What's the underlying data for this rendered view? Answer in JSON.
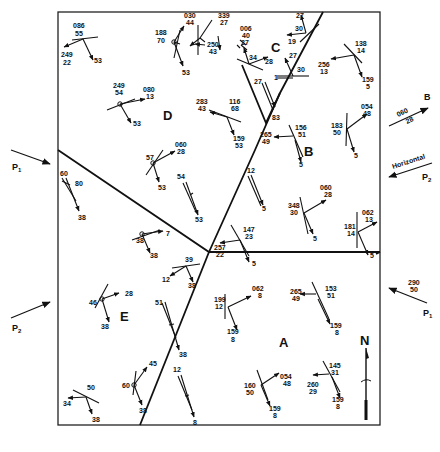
{
  "diagram": {
    "type": "structural-geology-map",
    "zones": [
      {
        "id": "A",
        "label": "A",
        "x": 284,
        "y": 342
      },
      {
        "id": "B",
        "label": "B",
        "x": 308,
        "y": 151
      },
      {
        "id": "C",
        "label": "C",
        "x": 276,
        "y": 48
      },
      {
        "id": "D",
        "label": "D",
        "x": 168,
        "y": 115
      },
      {
        "id": "E",
        "label": "E",
        "x": 125,
        "y": 316
      }
    ],
    "north_arrow": {
      "label": "N"
    },
    "external_stresses": [
      {
        "id": "P1-west",
        "label": "P",
        "sub": "1"
      },
      {
        "id": "P2-west",
        "label": "P",
        "sub": "2"
      },
      {
        "id": "B-east",
        "label": "B",
        "value_top": "060",
        "value_bottom": "28"
      },
      {
        "id": "P2-east",
        "label": "P",
        "sub": "2",
        "note": "Horizontal"
      },
      {
        "id": "P1-east",
        "label": "P",
        "sub": "1",
        "value_top": "290",
        "value_bottom": "50"
      }
    ],
    "labels": [
      {
        "t": "086",
        "x": 73,
        "y": 28
      },
      {
        "t": "55",
        "x": 75,
        "y": 36
      },
      {
        "t": "249",
        "x": 61,
        "y": 57
      },
      {
        "t": "22",
        "x": 63,
        "y": 65
      },
      {
        "t": "53",
        "x": 94,
        "y": 63
      },
      {
        "t": "030",
        "x": 184,
        "y": 18
      },
      {
        "t": "44",
        "x": 186,
        "y": 25
      },
      {
        "t": "188",
        "x": 155,
        "y": 35
      },
      {
        "t": "70",
        "x": 157,
        "y": 43
      },
      {
        "t": "53",
        "x": 182,
        "y": 75
      },
      {
        "t": "339",
        "x": 218,
        "y": 18
      },
      {
        "t": "27",
        "x": 220,
        "y": 25
      },
      {
        "t": "006",
        "x": 240,
        "y": 31
      },
      {
        "t": "40",
        "x": 242,
        "y": 38
      },
      {
        "t": "250",
        "x": 207,
        "y": 47
      },
      {
        "t": "43",
        "x": 209,
        "y": 54
      },
      {
        "t": "27",
        "x": 241,
        "y": 45
      },
      {
        "t": "34",
        "x": 249,
        "y": 60
      },
      {
        "t": "28",
        "x": 265,
        "y": 64
      },
      {
        "t": "27",
        "x": 296,
        "y": 18
      },
      {
        "t": "30",
        "x": 295,
        "y": 31
      },
      {
        "t": "19",
        "x": 288,
        "y": 44
      },
      {
        "t": "27",
        "x": 289,
        "y": 58
      },
      {
        "t": "30",
        "x": 297,
        "y": 72
      },
      {
        "t": "1",
        "x": 274,
        "y": 80
      },
      {
        "t": "27",
        "x": 254,
        "y": 84
      },
      {
        "t": "83",
        "x": 272,
        "y": 120
      },
      {
        "t": "138",
        "x": 355,
        "y": 46
      },
      {
        "t": "14",
        "x": 357,
        "y": 53
      },
      {
        "t": "256",
        "x": 318,
        "y": 67
      },
      {
        "t": "13",
        "x": 320,
        "y": 74
      },
      {
        "t": "159",
        "x": 362,
        "y": 82
      },
      {
        "t": "5",
        "x": 366,
        "y": 89
      },
      {
        "t": "249",
        "x": 113,
        "y": 88
      },
      {
        "t": "54",
        "x": 115,
        "y": 95
      },
      {
        "t": "080",
        "x": 143,
        "y": 92
      },
      {
        "t": "13",
        "x": 146,
        "y": 99
      },
      {
        "t": "53",
        "x": 133,
        "y": 126
      },
      {
        "t": "283",
        "x": 196,
        "y": 104
      },
      {
        "t": "43",
        "x": 198,
        "y": 111
      },
      {
        "t": "116",
        "x": 229,
        "y": 104
      },
      {
        "t": "68",
        "x": 231,
        "y": 111
      },
      {
        "t": "159",
        "x": 233,
        "y": 141
      },
      {
        "t": "53",
        "x": 235,
        "y": 148
      },
      {
        "t": "265",
        "x": 260,
        "y": 137
      },
      {
        "t": "49",
        "x": 262,
        "y": 144
      },
      {
        "t": "156",
        "x": 295,
        "y": 130
      },
      {
        "t": "51",
        "x": 298,
        "y": 137
      },
      {
        "t": "5",
        "x": 299,
        "y": 167
      },
      {
        "t": "183",
        "x": 331,
        "y": 128
      },
      {
        "t": "50",
        "x": 333,
        "y": 135
      },
      {
        "t": "054",
        "x": 361,
        "y": 109
      },
      {
        "t": "48",
        "x": 363,
        "y": 116
      },
      {
        "t": "5",
        "x": 354,
        "y": 158
      },
      {
        "t": "057",
        "x": 0,
        "y": 0
      },
      {
        "t": "060",
        "x": 175,
        "y": 147
      },
      {
        "t": "28",
        "x": 177,
        "y": 154
      },
      {
        "t": "57",
        "x": 146,
        "y": 160
      },
      {
        "t": "53",
        "x": 158,
        "y": 190
      },
      {
        "t": "54",
        "x": 177,
        "y": 179
      },
      {
        "t": "53",
        "x": 195,
        "y": 222
      },
      {
        "t": "60",
        "x": 60,
        "y": 176
      },
      {
        "t": "80",
        "x": 75,
        "y": 186
      },
      {
        "t": "38",
        "x": 78,
        "y": 220
      },
      {
        "t": "12",
        "x": 247,
        "y": 173
      },
      {
        "t": "5",
        "x": 262,
        "y": 211
      },
      {
        "t": "060",
        "x": 320,
        "y": 190
      },
      {
        "t": "28",
        "x": 324,
        "y": 197
      },
      {
        "t": "348",
        "x": 288,
        "y": 208
      },
      {
        "t": "30",
        "x": 290,
        "y": 215
      },
      {
        "t": "5",
        "x": 313,
        "y": 241
      },
      {
        "t": "062",
        "x": 362,
        "y": 215
      },
      {
        "t": "13",
        "x": 365,
        "y": 222
      },
      {
        "t": "181",
        "x": 344,
        "y": 229
      },
      {
        "t": "14",
        "x": 347,
        "y": 236
      },
      {
        "t": "5",
        "x": 370,
        "y": 258
      },
      {
        "t": "147",
        "x": 243,
        "y": 232
      },
      {
        "t": "23",
        "x": 245,
        "y": 239
      },
      {
        "t": "257",
        "x": 214,
        "y": 250
      },
      {
        "t": "22",
        "x": 216,
        "y": 257
      },
      {
        "t": "5",
        "x": 252,
        "y": 266
      },
      {
        "t": "7",
        "x": 166,
        "y": 236
      },
      {
        "t": "38",
        "x": 136,
        "y": 243
      },
      {
        "t": "38",
        "x": 150,
        "y": 258
      },
      {
        "t": "39",
        "x": 185,
        "y": 262
      },
      {
        "t": "12",
        "x": 162,
        "y": 282
      },
      {
        "t": "38",
        "x": 188,
        "y": 288
      },
      {
        "t": "28",
        "x": 125,
        "y": 296
      },
      {
        "t": "46",
        "x": 89,
        "y": 305
      },
      {
        "t": "38",
        "x": 101,
        "y": 329
      },
      {
        "t": "51",
        "x": 155,
        "y": 305
      },
      {
        "t": "38",
        "x": 179,
        "y": 357
      },
      {
        "t": "199",
        "x": 214,
        "y": 302
      },
      {
        "t": "12",
        "x": 215,
        "y": 309
      },
      {
        "t": "062",
        "x": 252,
        "y": 291
      },
      {
        "t": "8",
        "x": 258,
        "y": 298
      },
      {
        "t": "159",
        "x": 227,
        "y": 334
      },
      {
        "t": "8",
        "x": 231,
        "y": 342
      },
      {
        "t": "265",
        "x": 290,
        "y": 294
      },
      {
        "t": "49",
        "x": 292,
        "y": 301
      },
      {
        "t": "153",
        "x": 325,
        "y": 291
      },
      {
        "t": "51",
        "x": 327,
        "y": 298
      },
      {
        "t": "159",
        "x": 330,
        "y": 328
      },
      {
        "t": "8",
        "x": 335,
        "y": 335
      },
      {
        "t": "45",
        "x": 149,
        "y": 366
      },
      {
        "t": "12",
        "x": 173,
        "y": 372
      },
      {
        "t": "60",
        "x": 122,
        "y": 388
      },
      {
        "t": "38",
        "x": 139,
        "y": 413
      },
      {
        "t": "8",
        "x": 193,
        "y": 425
      },
      {
        "t": "50",
        "x": 87,
        "y": 390
      },
      {
        "t": "34",
        "x": 63,
        "y": 406
      },
      {
        "t": "38",
        "x": 92,
        "y": 422
      },
      {
        "t": "054",
        "x": 280,
        "y": 379
      },
      {
        "t": "48",
        "x": 283,
        "y": 386
      },
      {
        "t": "160",
        "x": 244,
        "y": 388
      },
      {
        "t": "50",
        "x": 246,
        "y": 395
      },
      {
        "t": "159",
        "x": 269,
        "y": 411
      },
      {
        "t": "8",
        "x": 273,
        "y": 418
      },
      {
        "t": "145",
        "x": 329,
        "y": 368
      },
      {
        "t": "31",
        "x": 331,
        "y": 375
      },
      {
        "t": "260",
        "x": 307,
        "y": 387
      },
      {
        "t": "29",
        "x": 309,
        "y": 394
      },
      {
        "t": "159",
        "x": 332,
        "y": 402
      },
      {
        "t": "8",
        "x": 336,
        "y": 409
      }
    ],
    "colors": {
      "ink": "#111111",
      "background": "#ffffff"
    }
  }
}
